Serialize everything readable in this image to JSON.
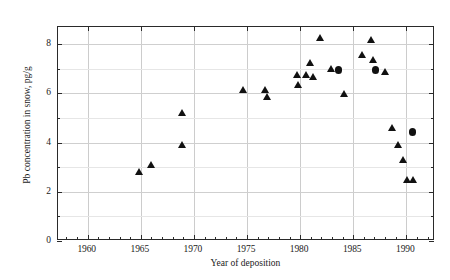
{
  "chart_data": {
    "type": "scatter",
    "title": "",
    "xlabel": "Year of deposition",
    "ylabel": "Pb concentration in snow, pg/g",
    "xlim": [
      1957.2,
      1992.7
    ],
    "ylim": [
      0,
      8.7
    ],
    "xticks": [
      1960,
      1965,
      1970,
      1975,
      1980,
      1985,
      1990
    ],
    "xticklabels": [
      "1960",
      "1965",
      "1970",
      "1975",
      "1980",
      "1985",
      "1990"
    ],
    "yticks": [
      0,
      2,
      4,
      6,
      8
    ],
    "yticklabels": [
      "0",
      "2",
      "4",
      "6",
      "8"
    ],
    "yticks_minor": [
      1,
      3,
      5,
      7
    ],
    "grid": true,
    "legend": null,
    "series": [
      {
        "name": "triangle-markers",
        "marker": "triangle",
        "color": "#111111",
        "points": [
          {
            "x": 1964.8,
            "y": 2.77
          },
          {
            "x": 1966.0,
            "y": 3.05
          },
          {
            "x": 1968.9,
            "y": 5.15
          },
          {
            "x": 1968.9,
            "y": 3.87
          },
          {
            "x": 1974.6,
            "y": 6.08
          },
          {
            "x": 1976.7,
            "y": 6.09
          },
          {
            "x": 1976.9,
            "y": 5.8
          },
          {
            "x": 1979.7,
            "y": 6.71
          },
          {
            "x": 1979.8,
            "y": 6.31
          },
          {
            "x": 1980.6,
            "y": 6.68
          },
          {
            "x": 1980.9,
            "y": 7.2
          },
          {
            "x": 1981.2,
            "y": 6.62
          },
          {
            "x": 1981.9,
            "y": 8.2
          },
          {
            "x": 1982.9,
            "y": 6.95
          },
          {
            "x": 1984.1,
            "y": 5.94
          },
          {
            "x": 1985.8,
            "y": 7.52
          },
          {
            "x": 1986.7,
            "y": 8.12
          },
          {
            "x": 1986.9,
            "y": 7.33
          },
          {
            "x": 1988.0,
            "y": 6.83
          },
          {
            "x": 1988.7,
            "y": 4.55
          },
          {
            "x": 1989.2,
            "y": 3.85
          },
          {
            "x": 1989.7,
            "y": 3.25
          },
          {
            "x": 1990.1,
            "y": 2.45
          },
          {
            "x": 1990.6,
            "y": 2.45
          }
        ]
      },
      {
        "name": "circle-markers",
        "marker": "circle",
        "color": "#111111",
        "points": [
          {
            "x": 1983.6,
            "y": 6.94
          },
          {
            "x": 1987.1,
            "y": 6.94
          },
          {
            "x": 1990.6,
            "y": 4.44
          }
        ]
      }
    ]
  },
  "axes": {
    "x_title": "Year of deposition",
    "y_title": "Pb concentration in snow, pg/g"
  }
}
